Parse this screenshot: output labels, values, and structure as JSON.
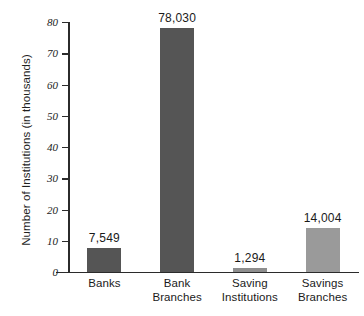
{
  "chart_data": {
    "type": "bar",
    "title": "",
    "subtitle": "",
    "xlabel": "",
    "ylabel": "Number of Institutions (in thousands)",
    "ylim": [
      0,
      80
    ],
    "yticks": [
      0,
      10,
      20,
      30,
      40,
      50,
      60,
      70,
      80
    ],
    "ytick_labels": [
      "0",
      "10",
      "20",
      "30",
      "40",
      "50",
      "60",
      "70",
      "80"
    ],
    "grid": false,
    "legend": false,
    "units": "thousands",
    "categories": [
      "Banks",
      "Bank Branches",
      "Saving Institutions",
      "Savings Branches"
    ],
    "category_lines": [
      [
        "Banks"
      ],
      [
        "Bank",
        "Branches"
      ],
      [
        "Saving",
        "Institutions"
      ],
      [
        "Savings",
        "Branches"
      ]
    ],
    "values": [
      7.549,
      78.03,
      1.294,
      14.004
    ],
    "data_labels": [
      "7,549",
      "78,030",
      "1,294",
      "14,004"
    ],
    "bar_colors": [
      "#555555",
      "#555555",
      "#8e8e8e",
      "#9a9a9a"
    ],
    "colors": {
      "axis": "#2b2b2b",
      "text": "#1a1a1a",
      "background": "#ffffff",
      "bar_dark": "#555555",
      "bar_light": "#9a9a9a"
    }
  }
}
